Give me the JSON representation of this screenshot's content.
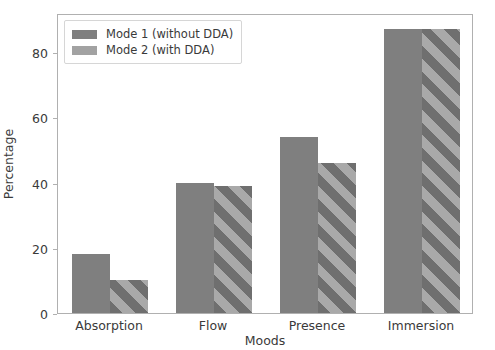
{
  "chart_data": {
    "type": "bar",
    "title": "",
    "xlabel": "Moods",
    "ylabel": "Percentage",
    "categories": [
      "Absorption",
      "Flow",
      "Presence",
      "Immersion"
    ],
    "series": [
      {
        "name": "Mode 1 (without DDA)",
        "values": [
          18,
          40,
          54,
          87
        ],
        "color": "#7f7f7f",
        "hatch": "none"
      },
      {
        "name": "Mode 2 (with DDA)",
        "values": [
          10,
          39,
          46,
          87
        ],
        "color": "#a9a9a9",
        "hatch": "diagonal"
      }
    ],
    "ylim": [
      0,
      92
    ],
    "yticks": [
      0,
      20,
      40,
      60,
      80
    ],
    "ytick_labels": [
      "0",
      "20",
      "40",
      "60",
      "80"
    ],
    "grid": false,
    "legend_position": "upper left"
  },
  "legend": {
    "entries": [
      {
        "label": "Mode 1 (without DDA)"
      },
      {
        "label": "Mode 2 (with DDA)"
      }
    ]
  }
}
